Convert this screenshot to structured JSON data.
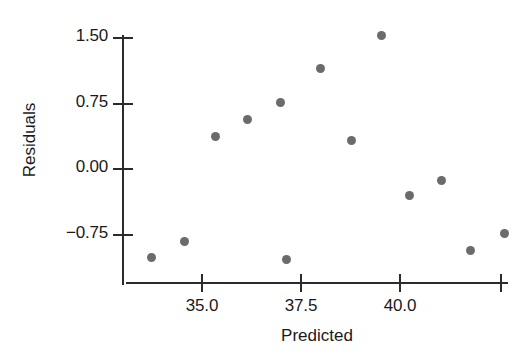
{
  "chart_data": {
    "type": "scatter",
    "title": "",
    "xlabel": "Predicted",
    "ylabel": "Residuals",
    "xlim": [
      33.2,
      43.0
    ],
    "ylim": [
      -1.25,
      1.7
    ],
    "grid": false,
    "legend": null,
    "x_ticks": [
      {
        "value": 35.0,
        "label": "35.0"
      },
      {
        "value": 37.5,
        "label": "37.5"
      },
      {
        "value": 40.0,
        "label": "40.0"
      },
      {
        "value": 42.5,
        "label": ""
      }
    ],
    "y_ticks": [
      {
        "value": 1.5,
        "label": "1.50"
      },
      {
        "value": 0.75,
        "label": "0.75"
      },
      {
        "value": 0.0,
        "label": "0.00"
      },
      {
        "value": -0.75,
        "label": "−0.75"
      }
    ],
    "marker": {
      "shape": "circle",
      "color": "#6b6b6b",
      "size_px": 9
    },
    "points": [
      {
        "x": 33.75,
        "y": -1.03
      },
      {
        "x": 34.58,
        "y": -0.84
      },
      {
        "x": 35.36,
        "y": 0.36
      },
      {
        "x": 37.17,
        "y": -1.05
      },
      {
        "x": 36.17,
        "y": 0.55
      },
      {
        "x": 37.0,
        "y": 0.75
      },
      {
        "x": 38.02,
        "y": 1.14
      },
      {
        "x": 38.81,
        "y": 0.32
      },
      {
        "x": 39.57,
        "y": 1.52
      },
      {
        "x": 40.27,
        "y": -0.31
      },
      {
        "x": 41.08,
        "y": -0.14
      },
      {
        "x": 41.81,
        "y": -0.94
      },
      {
        "x": 42.66,
        "y": -0.75
      }
    ],
    "series_name": "residuals"
  },
  "axes": {
    "x_axis_color": "#2b2b2b",
    "y_axis_color": "#2b2b2b"
  }
}
